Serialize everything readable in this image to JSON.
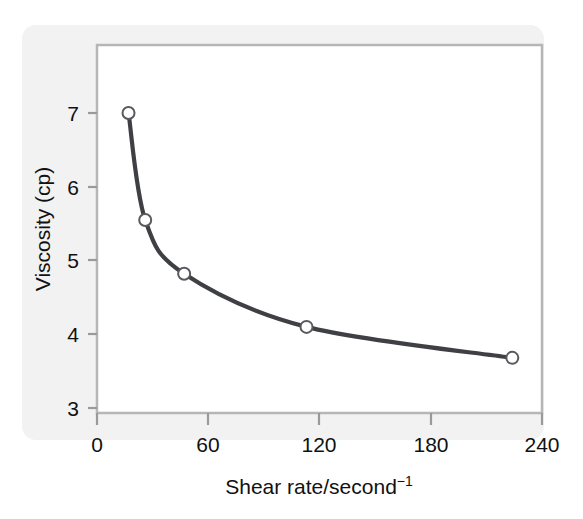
{
  "chart_data": {
    "type": "line",
    "title": "",
    "subtitle": "",
    "xlabel": "Shear rate/second",
    "xlabel_superscript": "−1",
    "xlabel_full": "Shear rate/second⁻¹",
    "ylabel": "Viscosity (cp)",
    "xlim": [
      0,
      240
    ],
    "ylim": [
      3,
      7.6
    ],
    "xticks": [
      0,
      60,
      120,
      180,
      240
    ],
    "xtick_labels": [
      "0",
      "60",
      "120",
      "180",
      "240"
    ],
    "yticks": [
      3,
      4,
      5,
      6,
      7
    ],
    "ytick_labels": [
      "3",
      "4",
      "5",
      "6",
      "7"
    ],
    "grid": false,
    "legend": false,
    "legend_position": "none",
    "series": [
      {
        "name": "Viscosity vs shear rate",
        "x": [
          17,
          26,
          47,
          113,
          224
        ],
        "values": [
          7.0,
          5.55,
          4.82,
          4.1,
          3.68
        ],
        "marker": "open-circle",
        "line_color": "#3f4044",
        "marker_face_color": "#ffffff",
        "marker_edge_color": "#5a5a5e"
      }
    ],
    "annotations": []
  },
  "style": {
    "panel_background": "#f2f2f2",
    "plot_background": "#ffffff",
    "frame_color": "#b6b6b6",
    "axis_color": "#9a9a9a",
    "text_color": "#111111",
    "curve_color": "#3f4044"
  },
  "axes": {
    "x_axis_name": "shear-rate-axis",
    "y_axis_name": "viscosity-axis"
  }
}
